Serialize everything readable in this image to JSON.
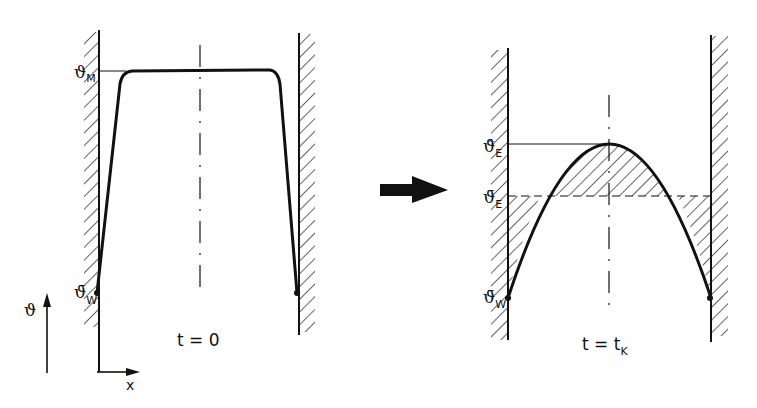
{
  "left_panel": {
    "caption": "t = 0",
    "labels": {
      "theta_M": {
        "symbol": "ϑ",
        "sub": "M"
      },
      "theta_W": {
        "symbol": "ϑ̄",
        "sub": "W"
      }
    },
    "axis": {
      "y_label": "ϑ",
      "x_label": "x"
    }
  },
  "transition_arrow": "right-arrow",
  "right_panel": {
    "caption_main": "t = t",
    "caption_sub": "K",
    "labels": {
      "theta_E_hat": {
        "symbol": "ϑ̂",
        "sub": "E"
      },
      "theta_E_bar": {
        "symbol": "ϑ̄",
        "sub": "E"
      },
      "theta_W_bar": {
        "symbol": "ϑ̄",
        "sub": "W"
      }
    }
  },
  "colors": {
    "ink": "#111111",
    "background": "#ffffff"
  }
}
